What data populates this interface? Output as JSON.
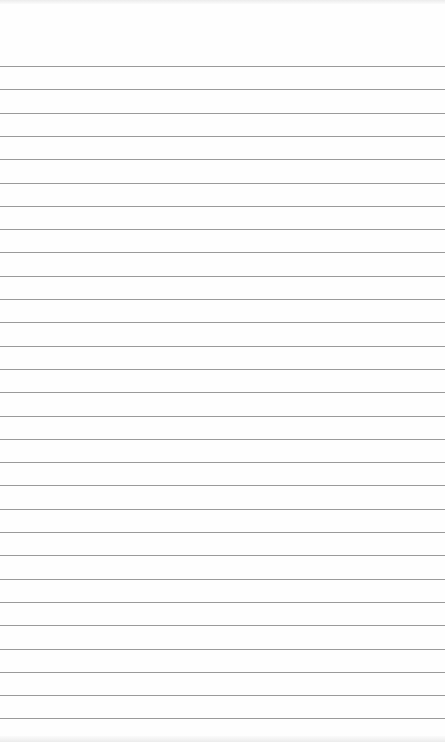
{
  "note": {
    "text": "",
    "line_count": 29,
    "first_line_y": 66,
    "line_spacing": 23.3,
    "line_color": "#9a9a9a",
    "background_color": "#fefefe"
  }
}
